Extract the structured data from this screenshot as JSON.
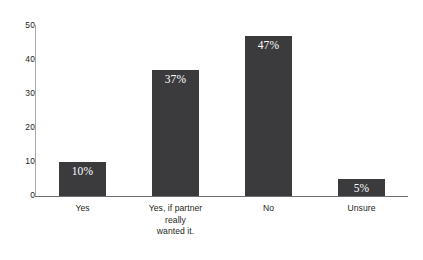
{
  "chart_data": {
    "type": "bar",
    "title": "",
    "xlabel": "",
    "ylabel": "",
    "categories": [
      "Yes",
      "Yes, if partner really wanted it.",
      "No",
      "Unsure"
    ],
    "category_lines": [
      [
        "Yes"
      ],
      [
        "Yes, if partner",
        "really",
        "wanted it."
      ],
      [
        "No"
      ],
      [
        "Unsure"
      ]
    ],
    "values": [
      10,
      37,
      47,
      5
    ],
    "data_labels": [
      "10%",
      "37%",
      "47%",
      "5%"
    ],
    "ylim": [
      0,
      50
    ],
    "yticks": [
      0,
      10,
      20,
      30,
      40,
      50
    ],
    "ytick_labels": [
      "0",
      "10",
      "20",
      "30",
      "40",
      "50"
    ],
    "grid": false,
    "legend": null,
    "bar_color": "#3b3b3d",
    "axis_color": "#6d6e71",
    "text_color": "#231f20",
    "value_label_color": "#ffffff"
  },
  "clipped_header_text": ""
}
